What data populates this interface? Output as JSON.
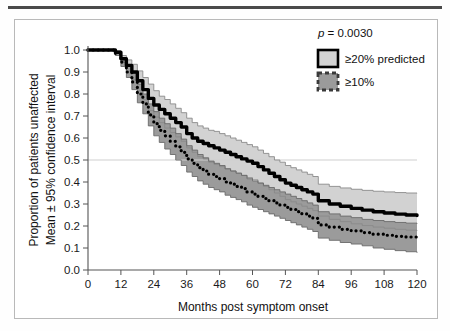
{
  "figure": {
    "background": "#ffffff",
    "frame_color": "#b9b9b9",
    "top_rule_color": "#4a4a4a"
  },
  "chart_data": {
    "type": "line",
    "title": "",
    "subtitle": "",
    "xlabel": "Months post symptom onset",
    "ylabel_line1": "Proportion of patients unaffected",
    "ylabel_line2": "Mean ± 95% confidence interval",
    "xlim": [
      0,
      120
    ],
    "ylim": [
      0.0,
      1.0
    ],
    "xticks": [
      0,
      12,
      24,
      36,
      48,
      60,
      72,
      84,
      96,
      108,
      120
    ],
    "xtick_labels": [
      "0",
      "12",
      "24",
      "36",
      "48",
      "60",
      "72",
      "84",
      "96",
      "108",
      "120"
    ],
    "yticks": [
      0.0,
      0.1,
      0.2,
      0.3,
      0.4,
      0.5,
      0.6,
      0.7,
      0.8,
      0.9,
      1.0
    ],
    "ytick_labels": [
      "0.0",
      "0.1",
      "0.2",
      "0.3",
      "0.4",
      "0.5",
      "0.6",
      "0.7",
      "0.8",
      "0.9",
      "1.0"
    ],
    "grid": false,
    "reference_line": {
      "y": 0.5,
      "color": "#cfcfcf",
      "label": ""
    },
    "legend_position": "top-right",
    "annotations": [
      {
        "text": "p = 0.0030",
        "x": 90,
        "y": 0.95
      }
    ],
    "series": [
      {
        "name": "≥20% predicted",
        "style": "solid",
        "line_color": "#000000",
        "band_color": "#d2d2d2",
        "band_edge_color": "#8a8a8a",
        "x": [
          0,
          4,
          8,
          10,
          12,
          14,
          16,
          18,
          20,
          22,
          24,
          26,
          28,
          30,
          32,
          34,
          36,
          38,
          40,
          42,
          44,
          46,
          48,
          50,
          52,
          54,
          56,
          58,
          60,
          62,
          64,
          66,
          68,
          70,
          72,
          74,
          76,
          78,
          80,
          82,
          84,
          88,
          92,
          96,
          100,
          104,
          108,
          112,
          116,
          120
        ],
        "mean": [
          1.0,
          1.0,
          1.0,
          0.99,
          0.96,
          0.93,
          0.9,
          0.86,
          0.82,
          0.78,
          0.75,
          0.73,
          0.71,
          0.69,
          0.67,
          0.65,
          0.62,
          0.6,
          0.585,
          0.575,
          0.565,
          0.555,
          0.545,
          0.535,
          0.525,
          0.515,
          0.505,
          0.495,
          0.485,
          0.47,
          0.455,
          0.44,
          0.425,
          0.41,
          0.395,
          0.385,
          0.375,
          0.365,
          0.355,
          0.345,
          0.315,
          0.3,
          0.29,
          0.28,
          0.272,
          0.265,
          0.259,
          0.254,
          0.25,
          0.248
        ],
        "lower": [
          1.0,
          1.0,
          1.0,
          0.985,
          0.945,
          0.905,
          0.865,
          0.815,
          0.775,
          0.725,
          0.695,
          0.67,
          0.645,
          0.625,
          0.605,
          0.585,
          0.555,
          0.535,
          0.515,
          0.505,
          0.49,
          0.48,
          0.47,
          0.46,
          0.45,
          0.44,
          0.43,
          0.42,
          0.41,
          0.395,
          0.38,
          0.365,
          0.35,
          0.335,
          0.32,
          0.31,
          0.3,
          0.29,
          0.28,
          0.27,
          0.245,
          0.23,
          0.22,
          0.21,
          0.202,
          0.195,
          0.19,
          0.185,
          0.181,
          0.178
        ],
        "upper": [
          1.0,
          1.0,
          1.0,
          0.995,
          0.975,
          0.955,
          0.935,
          0.905,
          0.875,
          0.845,
          0.815,
          0.79,
          0.775,
          0.755,
          0.735,
          0.715,
          0.69,
          0.67,
          0.655,
          0.645,
          0.635,
          0.63,
          0.62,
          0.61,
          0.6,
          0.59,
          0.58,
          0.57,
          0.56,
          0.545,
          0.53,
          0.515,
          0.5,
          0.49,
          0.475,
          0.465,
          0.455,
          0.445,
          0.435,
          0.425,
          0.39,
          0.38,
          0.373,
          0.367,
          0.362,
          0.358,
          0.355,
          0.352,
          0.35,
          0.349
        ]
      },
      {
        "name": "≥10%",
        "style": "dotted",
        "line_color": "#000000",
        "band_color": "#9b9b9b",
        "band_edge_color": "#6a6a6a",
        "x": [
          0,
          4,
          8,
          10,
          12,
          14,
          16,
          18,
          20,
          22,
          24,
          26,
          28,
          30,
          32,
          34,
          36,
          38,
          40,
          42,
          44,
          46,
          48,
          50,
          52,
          54,
          56,
          58,
          60,
          62,
          64,
          66,
          68,
          70,
          72,
          74,
          76,
          78,
          80,
          82,
          84,
          88,
          92,
          96,
          100,
          104,
          108,
          112,
          116,
          120
        ],
        "mean": [
          1.0,
          1.0,
          1.0,
          0.985,
          0.945,
          0.9,
          0.855,
          0.8,
          0.755,
          0.705,
          0.665,
          0.635,
          0.61,
          0.585,
          0.56,
          0.535,
          0.505,
          0.485,
          0.465,
          0.45,
          0.435,
          0.425,
          0.415,
          0.4,
          0.39,
          0.38,
          0.37,
          0.355,
          0.345,
          0.335,
          0.325,
          0.315,
          0.305,
          0.295,
          0.285,
          0.275,
          0.265,
          0.255,
          0.245,
          0.235,
          0.205,
          0.195,
          0.185,
          0.178,
          0.17,
          0.163,
          0.158,
          0.153,
          0.15,
          0.148
        ],
        "lower": [
          1.0,
          1.0,
          1.0,
          0.975,
          0.925,
          0.875,
          0.82,
          0.76,
          0.71,
          0.655,
          0.61,
          0.58,
          0.55,
          0.525,
          0.5,
          0.475,
          0.445,
          0.425,
          0.405,
          0.39,
          0.375,
          0.365,
          0.355,
          0.34,
          0.33,
          0.32,
          0.31,
          0.295,
          0.285,
          0.275,
          0.265,
          0.255,
          0.245,
          0.235,
          0.225,
          0.215,
          0.205,
          0.195,
          0.185,
          0.175,
          0.145,
          0.135,
          0.125,
          0.118,
          0.11,
          0.1,
          0.094,
          0.088,
          0.083,
          0.078
        ],
        "upper": [
          1.0,
          1.0,
          1.0,
          0.995,
          0.965,
          0.93,
          0.895,
          0.845,
          0.8,
          0.755,
          0.72,
          0.69,
          0.665,
          0.645,
          0.62,
          0.595,
          0.565,
          0.545,
          0.525,
          0.51,
          0.495,
          0.485,
          0.475,
          0.46,
          0.45,
          0.44,
          0.43,
          0.415,
          0.405,
          0.395,
          0.385,
          0.375,
          0.365,
          0.355,
          0.345,
          0.335,
          0.325,
          0.315,
          0.305,
          0.295,
          0.265,
          0.255,
          0.245,
          0.238,
          0.23,
          0.225,
          0.22,
          0.216,
          0.213,
          0.21
        ]
      }
    ]
  },
  "legend": {
    "pvalue_italic": "p",
    "pvalue_rest": " = 0.0030",
    "items": [
      {
        "label": "≥20% predicted",
        "swatch_fill": "#d2d2d2",
        "swatch_border": "#000000",
        "swatch_style": "solid"
      },
      {
        "label": "≥10%",
        "swatch_fill": "#9b9b9b",
        "swatch_border": "#3a3a3a",
        "swatch_style": "dashed"
      }
    ]
  }
}
